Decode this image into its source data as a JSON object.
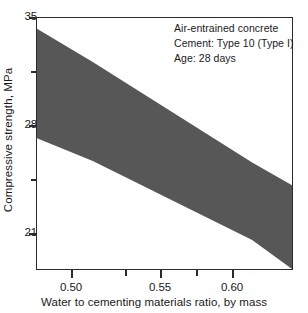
{
  "chart_data": {
    "type": "area",
    "title": "",
    "subtitle": "",
    "xlabel": "Water to cementing materials ratio, by mass",
    "ylabel": "Compressive strength, MPa",
    "xlim": [
      0.465,
      0.625
    ],
    "ylim": [
      18.5,
      35.0
    ],
    "grid": false,
    "legend_position": "none",
    "band_color": "#575757",
    "axis_color": "#2b2b2b",
    "x_ticks_major": [
      0.5,
      0.55,
      0.6
    ],
    "x_tick_labels": [
      "0.50",
      "0.55",
      "0.60"
    ],
    "x_ticks_minor": [
      0.525,
      0.575
    ],
    "y_ticks_major": [
      35,
      28,
      21
    ],
    "y_tick_labels": [
      "35",
      "28",
      "21"
    ],
    "y_ticks_minor": [
      31.5,
      24.5
    ],
    "series": [
      {
        "name": "Upper bound of compressive strength range",
        "x": [
          0.465,
          0.5,
          0.55,
          0.6,
          0.625
        ],
        "values": [
          34.3,
          32.1,
          28.8,
          25.5,
          24.0
        ]
      },
      {
        "name": "Lower bound of compressive strength range",
        "x": [
          0.465,
          0.5,
          0.55,
          0.6,
          0.625
        ],
        "values": [
          27.1,
          25.6,
          23.0,
          20.4,
          18.5
        ]
      }
    ],
    "annotations": [
      "Air-entrained concrete",
      "Cement: Type 10 (Type I)",
      "Age: 28 days"
    ]
  },
  "annotation": {
    "line1": "Air-entrained concrete",
    "line2": "Cement: Type 10 (Type I)",
    "line3": "Age: 28 days"
  },
  "axes": {
    "y_title": "Compressive strength, MPa",
    "x_title": "Water to cementing materials ratio, by mass",
    "y_labels": [
      "35",
      "28",
      "21"
    ],
    "x_labels": [
      "0.50",
      "0.55",
      "0.60"
    ]
  }
}
